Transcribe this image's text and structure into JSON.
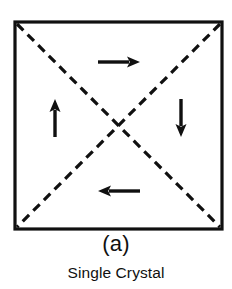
{
  "figure": {
    "panel_label": "(a)",
    "caption": "Single Crystal",
    "ink_color": "#101010",
    "background_color": "#ffffff",
    "square": {
      "name": "crystal-boundary",
      "x": 15,
      "y": 22,
      "width": 207,
      "height": 207,
      "stroke_width": 3.2,
      "style": "solid"
    },
    "diagonals": [
      {
        "name": "domain-wall-diagonal-tl-br",
        "x1": 17,
        "y1": 24,
        "x2": 220,
        "y2": 227,
        "style": "dashed",
        "dash": "9 6",
        "stroke_width": 3.2
      },
      {
        "name": "domain-wall-diagonal-tr-bl",
        "x1": 220,
        "y1": 24,
        "x2": 17,
        "y2": 227,
        "style": "dashed",
        "dash": "9 6",
        "stroke_width": 3.2
      }
    ],
    "arrows": [
      {
        "name": "magnetization-arrow-top",
        "direction": "right",
        "tail_x": 98,
        "tail_y": 62,
        "head_x": 140,
        "head_y": 62,
        "stroke_width": 3.4,
        "head_length": 13,
        "head_width": 11
      },
      {
        "name": "magnetization-arrow-left",
        "direction": "up",
        "tail_x": 55,
        "tail_y": 137,
        "head_x": 55,
        "head_y": 99,
        "stroke_width": 3.4,
        "head_length": 13,
        "head_width": 11
      },
      {
        "name": "magnetization-arrow-right",
        "direction": "down",
        "tail_x": 181,
        "tail_y": 99,
        "head_x": 181,
        "head_y": 137,
        "stroke_width": 3.4,
        "head_length": 13,
        "head_width": 11
      },
      {
        "name": "magnetization-arrow-bottom",
        "direction": "left",
        "tail_x": 140,
        "tail_y": 191,
        "head_x": 98,
        "head_y": 191,
        "stroke_width": 3.4,
        "head_length": 13,
        "head_width": 11
      }
    ]
  }
}
